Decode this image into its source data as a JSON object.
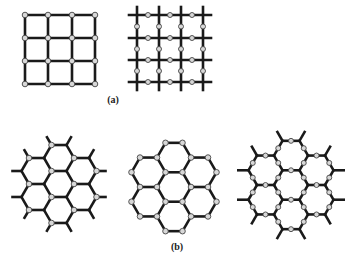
{
  "figure": {
    "labels": [
      {
        "id": "a",
        "text": "(a)",
        "x": 113,
        "y": 94
      },
      {
        "id": "b",
        "text": "(b)",
        "x": 177,
        "y": 241
      }
    ],
    "colors": {
      "bond": "#1a1a1a",
      "atom_fill": "#d8d8d8",
      "atom_stroke": "#444444",
      "background": "#ffffff"
    }
  },
  "lattices": [
    {
      "name": "square-lattice-atoms-at-vertices",
      "type": "square-vertex",
      "xs": [
        25,
        48,
        72,
        95
      ],
      "ys": [
        15,
        38,
        61,
        84
      ]
    },
    {
      "name": "square-lattice-atoms-on-bonds",
      "type": "square-bond",
      "xs": [
        137,
        159,
        181,
        203
      ],
      "ys": [
        15,
        38,
        60,
        82
      ],
      "overhang": 8
    },
    {
      "name": "hexagonal-lattice-one-sublattice",
      "type": "hex",
      "cx": 59,
      "cy": 184,
      "r": 15,
      "atoms": "sublattice",
      "stubs": true
    },
    {
      "name": "hexagonal-lattice-all-vertices",
      "type": "hex",
      "cx": 174,
      "cy": 187,
      "r": 17,
      "atoms": "all",
      "stubs": false
    },
    {
      "name": "hexagonal-lattice-atoms-on-bonds",
      "type": "hex",
      "cx": 291,
      "cy": 185,
      "r": 17,
      "atoms": "bonds",
      "stubs": true
    }
  ]
}
